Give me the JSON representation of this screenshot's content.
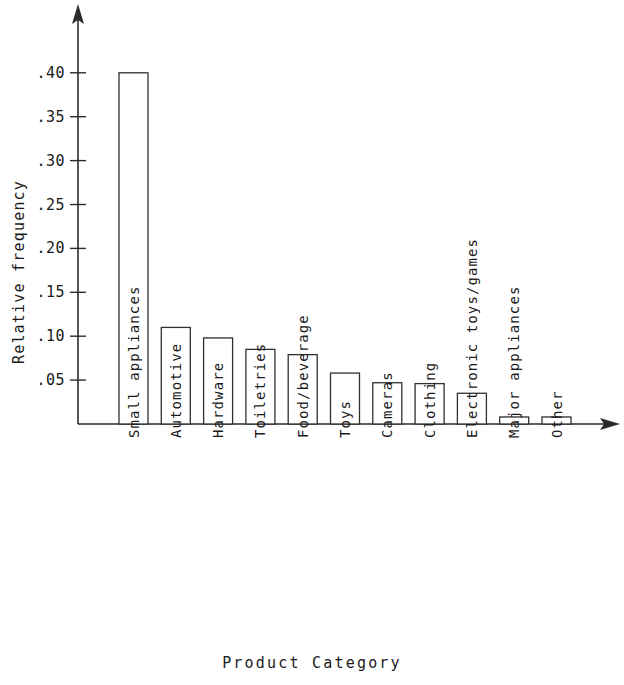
{
  "chart_data": {
    "type": "bar",
    "title": "",
    "subtitle": "",
    "xlabel": "Product Category",
    "ylabel": "Relative frequency",
    "categories": [
      "Small appliances",
      "Automotive",
      "Hardware",
      "Toiletries",
      "Food/beverage",
      "Toys",
      "Cameras",
      "Clothing",
      "Electronic toys/games",
      "Major appliances",
      "Other"
    ],
    "values": [
      0.4,
      0.11,
      0.098,
      0.085,
      0.079,
      0.058,
      0.047,
      0.046,
      0.035,
      0.008,
      0.008
    ],
    "ylim": [
      0.0,
      0.43
    ],
    "xlim_note": "categorical",
    "ytick_values": [
      0.05,
      0.1,
      0.15,
      0.2,
      0.25,
      0.3,
      0.35,
      0.4
    ],
    "ytick_labels": [
      ".05",
      ".10",
      ".15",
      ".20",
      ".25",
      ".30",
      ".35",
      ".40"
    ],
    "grid": false,
    "legend": null,
    "legend_position": "none",
    "bar_fill": "#ffffff",
    "bar_stroke": "#303030",
    "axis_color": "#2b2b2b",
    "axis_style": "arrow-terminated",
    "annotations": []
  }
}
